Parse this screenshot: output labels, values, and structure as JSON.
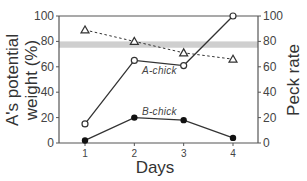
{
  "chart_data": {
    "type": "line",
    "title": "",
    "xlabel": "Days",
    "ylabel_left": "A's potential weight (%)",
    "ylabel_right": "Peck rate",
    "x": [
      1,
      2,
      3,
      4
    ],
    "x_tick_labels": [
      "1",
      "2",
      "3",
      "4"
    ],
    "y_left_ticks": [
      "0",
      "20",
      "40",
      "60",
      "80",
      "100"
    ],
    "y_right_ticks": [
      "0",
      "20",
      "40",
      "60",
      "80",
      "100"
    ],
    "ylim_left": [
      0,
      100
    ],
    "ylim_right": [
      0,
      100
    ],
    "grid": false,
    "shaded_band": {
      "axis": "left",
      "from": 75,
      "to": 80
    },
    "series": [
      {
        "name": "A-chick",
        "axis": "right",
        "marker": "open-circle",
        "line": "solid",
        "values": [
          15,
          65,
          61,
          100
        ]
      },
      {
        "name": "B-chick",
        "axis": "right",
        "marker": "filled-circle",
        "line": "solid",
        "values": [
          2,
          20,
          18,
          4
        ]
      },
      {
        "name": "A's potential weight",
        "axis": "left",
        "marker": "open-triangle",
        "line": "dashed",
        "values": [
          89,
          80,
          71,
          66
        ]
      }
    ],
    "annotations": [
      {
        "text": "A-chick",
        "near": "A-chick series between days 2 and 3"
      },
      {
        "text": "B-chick",
        "near": "B-chick series above day 2-3"
      }
    ]
  }
}
